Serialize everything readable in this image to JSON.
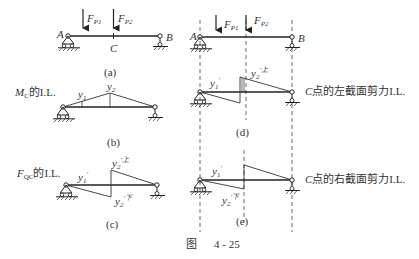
{
  "figure": {
    "caption_prefix": "图",
    "caption_number": "4 - 25"
  },
  "panels": {
    "a": {
      "label": "(a)",
      "loads": [
        {
          "name": "F",
          "sub": "P1"
        },
        {
          "name": "F",
          "sub": "P2"
        }
      ],
      "points": {
        "left": "A",
        "mid": "C",
        "right": "B"
      }
    },
    "b": {
      "label": "(b)",
      "title_main": "M",
      "title_sub": "C",
      "title_suffix": "的I.L.",
      "ordinates": {
        "y1": "y",
        "y1_sub": "1",
        "y2": "y",
        "y2_sub": "2"
      }
    },
    "c": {
      "label": "(c)",
      "title_main": "F",
      "title_sub": "QC",
      "title_suffix": "的I.L.",
      "ordinates": {
        "y1": "y",
        "y1_sub": "1",
        "y1_sup": "′",
        "y2_top": "y",
        "y2_top_sub": "2",
        "y2_top_sup": "′上",
        "y2_bot": "y",
        "y2_bot_sub": "2",
        "y2_bot_sup": "′下"
      }
    },
    "d": {
      "label": "(d)",
      "loads": [
        {
          "name": "F",
          "sub": "P1"
        },
        {
          "name": "F",
          "sub": "P2"
        }
      ],
      "points": {
        "left": "A",
        "right": "B"
      },
      "description_main": "C",
      "description_suffix": "点的左截面剪力I.L.",
      "ordinates": {
        "y1": "y",
        "y1_sub": "1",
        "y1_sup": "′",
        "y2": "y",
        "y2_sub": "2",
        "y2_sup": "′上"
      }
    },
    "e": {
      "label": "(e)",
      "description_main": "C",
      "description_suffix": "点的右截面剪力I.L.",
      "ordinates": {
        "y1": "y",
        "y1_sub": "1",
        "y1_sup": "′",
        "y2": "y",
        "y2_sub": "2",
        "y2_sup": "′下"
      }
    }
  }
}
